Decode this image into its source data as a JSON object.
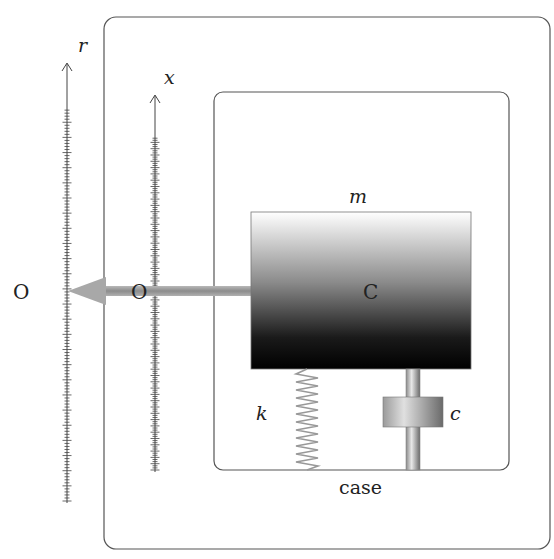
{
  "diagram": {
    "type": "accelerometer mass-spring-damper schematic",
    "labels": {
      "r_axis": "r",
      "x_axis": "x",
      "mass": "m",
      "center": "C",
      "origin_r": "O",
      "origin_x": "O",
      "spring": "k",
      "damper": "c",
      "case": "case"
    },
    "colors": {
      "line": "#555555",
      "arrow": "#9a9a9a",
      "mass_top": "#ffffff",
      "mass_bottom": "#000000",
      "text": "#222222"
    }
  }
}
